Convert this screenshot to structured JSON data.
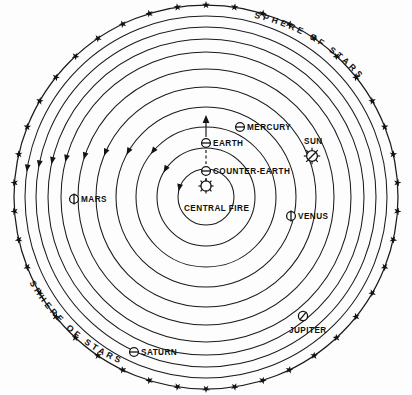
{
  "diagram": {
    "background_color": "#fdfdfd",
    "ink_color": "#141414",
    "center": {
      "x": 206,
      "y": 197
    },
    "outer_label_top": "SPHERE  OF  STARS",
    "outer_label_bottom": "SPHERE  OF  STARS",
    "star_count": 42,
    "orbit_count": 10
  },
  "labels": {
    "mercury": "MERCURY",
    "sun": "SUN",
    "earth": "EARTH",
    "counter_earth": "COUNTER-EARTH",
    "mars": "MARS",
    "venus": "VENUS",
    "central_fire": "CENTRAL FIRE",
    "jupiter": "JUPITER",
    "saturn": "SATURN",
    "sphere_of_stars_upper": "SPHERE  OF  STARS",
    "sphere_of_stars_lower": "SPHERE  OF  STARS"
  },
  "bodies": [
    {
      "name": "central-fire",
      "label": "CENTRAL FIRE",
      "symbol": "rayed-disc",
      "x": 206,
      "y": 186,
      "orbit_index": 0
    },
    {
      "name": "counter-earth",
      "label": "COUNTER-EARTH",
      "symbol": "circle-bar",
      "x": 206,
      "y": 171,
      "orbit_index": 1
    },
    {
      "name": "earth",
      "label": "EARTH",
      "symbol": "circle-bar",
      "x": 206,
      "y": 143,
      "orbit_index": 2
    },
    {
      "name": "mercury",
      "label": "MERCURY",
      "symbol": "circle-bar",
      "x": 240,
      "y": 127,
      "orbit_index": 3
    },
    {
      "name": "venus",
      "label": "VENUS",
      "symbol": "circle-slash-down",
      "x": 291,
      "y": 216,
      "orbit_index": 4
    },
    {
      "name": "sun",
      "label": "SUN",
      "symbol": "rayed-disc-slash",
      "x": 312,
      "y": 156,
      "orbit_index": 5
    },
    {
      "name": "mars",
      "label": "MARS",
      "symbol": "circle-bar",
      "x": 74,
      "y": 199,
      "orbit_index": 6
    },
    {
      "name": "jupiter",
      "label": "JUPITER",
      "symbol": "circle-slash-diagonal",
      "x": 303,
      "y": 316,
      "orbit_index": 7
    },
    {
      "name": "saturn",
      "label": "SATURN",
      "symbol": "circle-bar",
      "x": 134,
      "y": 352,
      "orbit_index": 8
    }
  ],
  "orbits": {
    "radii": [
      28,
      49,
      70,
      90,
      110,
      128,
      145,
      158,
      170,
      181
    ],
    "sphere_radius": 192,
    "direction": "counterclockwise"
  },
  "annotations": {
    "earth_arrow": "upward arrow from Earth",
    "dashed_segment": "dashed line linking Earth, Counter-Earth and Central Fire"
  }
}
